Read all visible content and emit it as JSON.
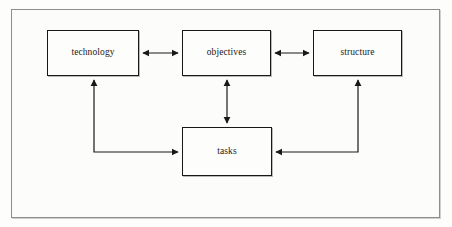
{
  "diagram": {
    "type": "block-flow-diagram",
    "background_color": "#fdfdfc",
    "frame_color": "#8d8d8d",
    "line_color": "#18181a",
    "nodes": [
      {
        "id": "technology",
        "label": "technology",
        "x": 47,
        "y": 30,
        "width": 92,
        "height": 46
      },
      {
        "id": "objectives",
        "label": "objectives",
        "x": 182,
        "y": 30,
        "width": 89,
        "height": 46
      },
      {
        "id": "structure",
        "label": "structure",
        "x": 313,
        "y": 30,
        "width": 89,
        "height": 46
      },
      {
        "id": "tasks",
        "label": "tasks",
        "x": 182,
        "y": 127,
        "width": 90,
        "height": 49
      }
    ],
    "edges": [
      {
        "from": "technology",
        "to": "objectives",
        "direction": "bidirectional",
        "shape": "straight-horizontal"
      },
      {
        "from": "objectives",
        "to": "structure",
        "direction": "bidirectional",
        "shape": "straight-horizontal"
      },
      {
        "from": "objectives",
        "to": "tasks",
        "direction": "bidirectional",
        "shape": "straight-vertical"
      },
      {
        "from": "tasks",
        "to": "technology",
        "direction": "bidirectional",
        "shape": "elbow-left"
      },
      {
        "from": "structure",
        "to": "tasks",
        "direction": "bidirectional",
        "shape": "elbow-right"
      }
    ]
  }
}
